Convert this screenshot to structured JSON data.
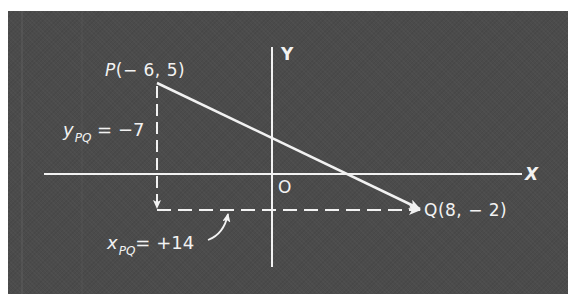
{
  "diagram": {
    "type": "coordinate-vector-diagram",
    "colors": {
      "background": "#4b4b4b",
      "foreground": "#f2f2f2",
      "page": "#ffffff"
    },
    "axes": {
      "x_label": "X",
      "y_label": "Y",
      "origin_label": "O"
    },
    "points": {
      "P": {
        "name": "P",
        "coords_text": "(− 6, 5)",
        "x": -6,
        "y": 5
      },
      "Q": {
        "name": "Q",
        "coords_text": "(8, − 2)",
        "x": 8,
        "y": -2
      }
    },
    "components": {
      "y": {
        "var": "y",
        "sub": "PQ",
        "value_text": "= −7",
        "value": -7
      },
      "x": {
        "var": "x",
        "sub": "PQ",
        "value_text": "= +14",
        "value": 14
      }
    },
    "vector": {
      "from": "P",
      "to": "Q",
      "style": "solid-arrow"
    }
  }
}
